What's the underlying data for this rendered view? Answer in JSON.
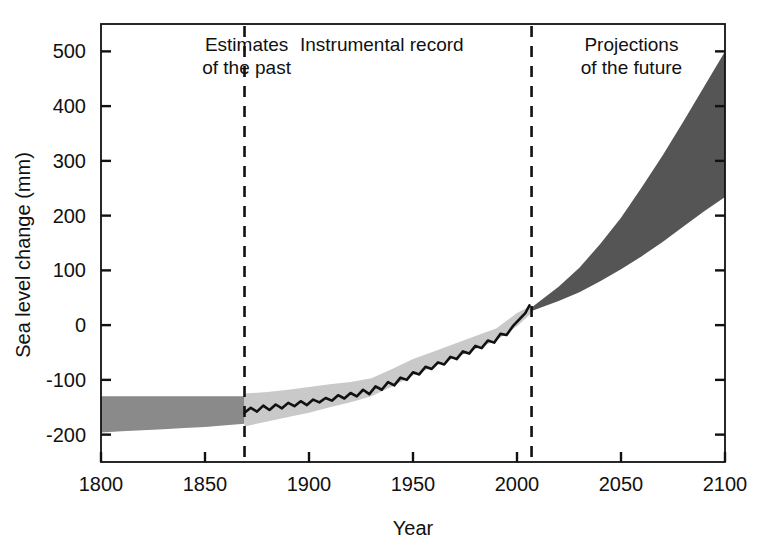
{
  "chart_data": {
    "type": "area",
    "title": "",
    "xlabel": "Year",
    "ylabel": "Sea level change (mm)",
    "xlim": [
      1800,
      2100
    ],
    "ylim": [
      -250,
      550
    ],
    "xticks": [
      1800,
      1850,
      1900,
      1950,
      2000,
      2050,
      2100
    ],
    "xtick_labels": [
      "1800",
      "1850",
      "1900",
      "1950",
      "2000",
      "2050",
      "2100"
    ],
    "yticks": [
      -200,
      -100,
      0,
      100,
      200,
      300,
      400,
      500
    ],
    "ytick_labels": [
      "-200",
      "-100",
      "0",
      "100",
      "200",
      "300",
      "400",
      "500"
    ],
    "grid": false,
    "legend": "none",
    "annotations": [
      {
        "name": "estimates-of-the-past",
        "line1": "Estimates",
        "line2": "of the past",
        "x_center": 1870,
        "align": "center"
      },
      {
        "name": "instrumental-record",
        "line1": "Instrumental record",
        "line2": "",
        "x_center": 1935,
        "align": "center"
      },
      {
        "name": "projections-of-the-future",
        "line1": "Projections",
        "line2": "of the future",
        "x_center": 2055,
        "align": "center"
      }
    ],
    "dividers": [
      {
        "name": "divider-1870",
        "x": 1869,
        "style": "dashed"
      },
      {
        "name": "divider-2007",
        "x": 2007,
        "style": "dashed"
      }
    ],
    "colors": {
      "past_band": "#8a8a8a",
      "instrumental_band": "#c9c9c9",
      "projection_band": "#555555",
      "record_line": "#111111",
      "axis": "#111111"
    },
    "series": [
      {
        "name": "Estimates of the past (uncertainty band)",
        "type": "band",
        "fill": "#8a8a8a",
        "x": [
          1800,
          1810,
          1820,
          1830,
          1840,
          1850,
          1860,
          1869
        ],
        "upper": [
          -130,
          -130,
          -130,
          -130,
          -130,
          -130,
          -130,
          -130
        ],
        "lower": [
          -196,
          -194,
          -192,
          -190,
          -188,
          -186,
          -183,
          -180
        ]
      },
      {
        "name": "Instrumental record (uncertainty band)",
        "type": "band",
        "fill": "#c9c9c9",
        "x": [
          1869,
          1880,
          1890,
          1900,
          1910,
          1920,
          1930,
          1940,
          1950,
          1960,
          1970,
          1980,
          1990,
          2000,
          2007
        ],
        "upper": [
          -125,
          -122,
          -118,
          -113,
          -108,
          -104,
          -97,
          -80,
          -62,
          -48,
          -34,
          -20,
          -6,
          22,
          36
        ],
        "lower": [
          -185,
          -176,
          -168,
          -160,
          -150,
          -141,
          -130,
          -112,
          -92,
          -76,
          -60,
          -44,
          -28,
          -2,
          22
        ]
      },
      {
        "name": "Instrumental record (observed)",
        "type": "line",
        "color": "#111111",
        "x": [
          1869,
          1872,
          1875,
          1878,
          1881,
          1884,
          1887,
          1890,
          1893,
          1896,
          1899,
          1902,
          1905,
          1908,
          1911,
          1914,
          1917,
          1920,
          1923,
          1926,
          1929,
          1932,
          1935,
          1938,
          1941,
          1944,
          1947,
          1950,
          1953,
          1956,
          1959,
          1962,
          1965,
          1968,
          1971,
          1974,
          1977,
          1980,
          1983,
          1986,
          1989,
          1992,
          1995,
          1998,
          2001,
          2004,
          2006
        ],
        "y": [
          -160,
          -151,
          -158,
          -147,
          -155,
          -145,
          -152,
          -142,
          -148,
          -139,
          -146,
          -136,
          -141,
          -133,
          -138,
          -128,
          -134,
          -124,
          -130,
          -118,
          -126,
          -112,
          -118,
          -104,
          -110,
          -96,
          -100,
          -86,
          -90,
          -76,
          -80,
          -68,
          -72,
          -58,
          -62,
          -48,
          -52,
          -38,
          -42,
          -28,
          -32,
          -16,
          -18,
          -2,
          10,
          22,
          36
        ]
      },
      {
        "name": "Projections of the future (range)",
        "type": "band",
        "fill": "#555555",
        "x": [
          2007,
          2020,
          2030,
          2040,
          2050,
          2060,
          2070,
          2080,
          2090,
          2100
        ],
        "upper": [
          32,
          70,
          105,
          148,
          196,
          252,
          310,
          372,
          436,
          500
        ],
        "lower": [
          26,
          44,
          60,
          80,
          102,
          126,
          152,
          180,
          208,
          234
        ]
      }
    ]
  }
}
